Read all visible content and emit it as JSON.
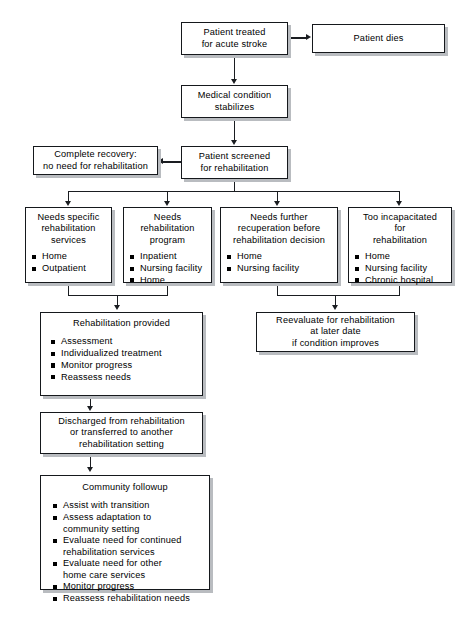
{
  "diagram": {
    "type": "flowchart",
    "orientation": "top-to-bottom",
    "colors": {
      "box_fill": "#ffffff",
      "box_border": "#15181c",
      "box_shadow": "#b9bcc0",
      "connector": "#1a1d21",
      "bullet": "#000000",
      "page_background": "#ffffff"
    }
  },
  "nodes": {
    "patient_treated": {
      "id": "patient-treated-for-acute-stroke",
      "title": "Patient treated\nfor acute stroke",
      "items": []
    },
    "patient_dies": {
      "id": "patient-dies",
      "title": "Patient dies",
      "items": []
    },
    "medical_condition": {
      "id": "medical-condition-stabilizes",
      "title": "Medical condition\nstabilizes",
      "items": []
    },
    "patient_screened": {
      "id": "patient-screened-for-rehabilitation",
      "title": "Patient screened\nfor rehabilitation",
      "items": []
    },
    "complete_recovery": {
      "id": "complete-recovery-no-need-for-rehabilitation",
      "title": "Complete recovery:\nno need for rehabilitation",
      "items": []
    },
    "needs_specific": {
      "id": "needs-specific-rehabilitation-services",
      "title": "Needs specific\nrehabilitation\nservices",
      "items": [
        "Home",
        "Outpatient"
      ]
    },
    "needs_program": {
      "id": "needs-rehabilitation-program",
      "title": "Needs\nrehabilitation\nprogram",
      "items": [
        "Inpatient",
        "Nursing facility",
        "Home"
      ]
    },
    "needs_recuperation": {
      "id": "needs-further-recuperation-before-rehabilitation-decision",
      "title": "Needs further\nrecuperation before\nrehabilitation decision",
      "items": [
        "Home",
        "Nursing facility"
      ]
    },
    "too_incapacitated": {
      "id": "too-incapacitated-for-rehabilitation",
      "title": "Too incapacitated\nfor\nrehabilitation",
      "items": [
        "Home",
        "Nursing facility",
        "Chronic hospital"
      ]
    },
    "rehabilitation_provided": {
      "id": "rehabilitation-provided",
      "title": "Rehabilitation provided",
      "items": [
        "Assessment",
        "Individualized treatment",
        "Monitor progress",
        "Reassess needs"
      ]
    },
    "reevaluate": {
      "id": "reevaluate-for-rehabilitation-at-later-date-if-condition-improves",
      "title": "Reevaluate for rehabilitation\nat later date\nif condition improves",
      "items": []
    },
    "discharged": {
      "id": "discharged-from-rehabilitation-or-transferred",
      "title": "Discharged from rehabilitation\nor transferred to another\nrehabilitation setting",
      "items": []
    },
    "community_followup": {
      "id": "community-followup",
      "title": "Community followup",
      "items": [
        "Assist with transition",
        "Assess adaptation to\ncommunity setting",
        "Evaluate need for continued\nrehabilitation services",
        "Evaluate need for other\nhome care services",
        "Monitor progress",
        "Reassess rehabilitation needs"
      ]
    }
  },
  "edges": [
    {
      "from": "patient_treated",
      "to": "patient_dies",
      "direction": "right"
    },
    {
      "from": "patient_treated",
      "to": "medical_condition",
      "direction": "down"
    },
    {
      "from": "medical_condition",
      "to": "patient_screened",
      "direction": "down"
    },
    {
      "from": "patient_screened",
      "to": "complete_recovery",
      "direction": "left"
    },
    {
      "from": "patient_screened",
      "to": "needs_specific",
      "direction": "down"
    },
    {
      "from": "patient_screened",
      "to": "needs_program",
      "direction": "down"
    },
    {
      "from": "patient_screened",
      "to": "needs_recuperation",
      "direction": "down"
    },
    {
      "from": "patient_screened",
      "to": "too_incapacitated",
      "direction": "down"
    },
    {
      "from": "needs_specific",
      "to": "rehabilitation_provided",
      "direction": "down"
    },
    {
      "from": "needs_program",
      "to": "rehabilitation_provided",
      "direction": "down"
    },
    {
      "from": "needs_recuperation",
      "to": "reevaluate",
      "direction": "down"
    },
    {
      "from": "too_incapacitated",
      "to": "reevaluate",
      "direction": "down"
    },
    {
      "from": "rehabilitation_provided",
      "to": "discharged",
      "direction": "down"
    },
    {
      "from": "discharged",
      "to": "community_followup",
      "direction": "down"
    }
  ]
}
